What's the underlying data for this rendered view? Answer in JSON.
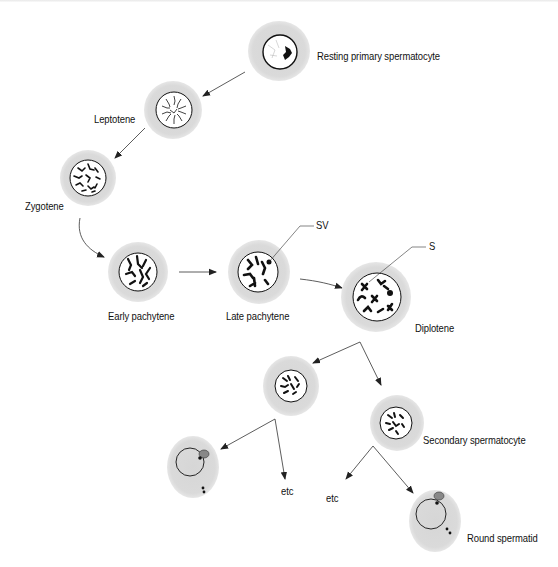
{
  "diagram": {
    "colors": {
      "cytoplasm": "#dcdcdc",
      "chromatin": "#111111",
      "nucleus_fill": "#ffffff",
      "line": "#333333"
    },
    "stages": [
      {
        "id": "resting",
        "label": "Resting primary spermatocyte"
      },
      {
        "id": "leptotene",
        "label": "Leptotene"
      },
      {
        "id": "zygotene",
        "label": "Zygotene"
      },
      {
        "id": "early_pachytene",
        "label": "Early pachytene"
      },
      {
        "id": "late_pachytene",
        "label": "Late pachytene"
      },
      {
        "id": "diplotene",
        "label": "Diplotene"
      },
      {
        "id": "secondary",
        "label": "Secondary spermatocyte"
      },
      {
        "id": "round_spermatid",
        "label": "Round spermatid"
      }
    ],
    "annotations": {
      "sv": "SV",
      "s": "S"
    },
    "continuation": {
      "left": "etc",
      "right": "etc"
    }
  }
}
